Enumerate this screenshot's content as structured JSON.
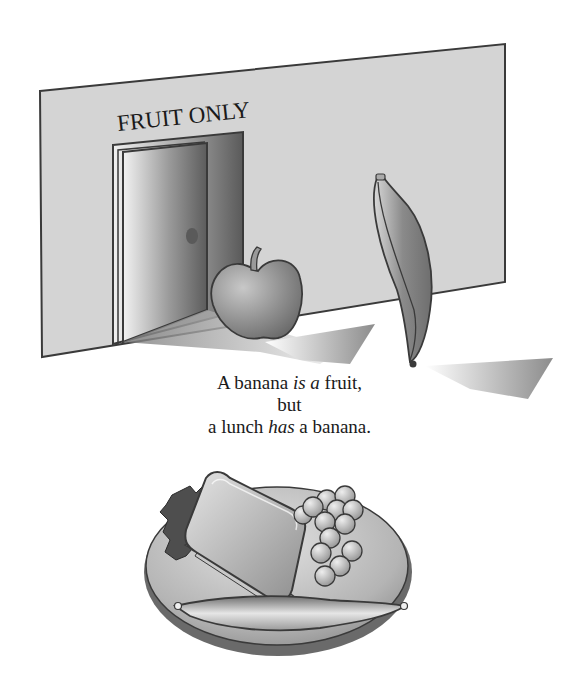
{
  "illustration": {
    "wall_sign": "FRUIT ONLY",
    "objects": [
      "wall",
      "door",
      "apple",
      "banana",
      "plate",
      "sandwich",
      "grapes",
      "banana-on-plate"
    ],
    "colors": {
      "wall": "#d4d4d4",
      "outline": "#3a3a3a",
      "shadow": "#a8a8a8",
      "fruit_dark": "#7a7a7a",
      "fruit_light": "#e0e0e0"
    }
  },
  "caption": {
    "line1": {
      "pre": "A banana ",
      "em1": "is a",
      "post": " fruit,"
    },
    "line2": "but",
    "line3": {
      "pre": "a lunch ",
      "em": "has",
      "post": " a banana."
    }
  }
}
